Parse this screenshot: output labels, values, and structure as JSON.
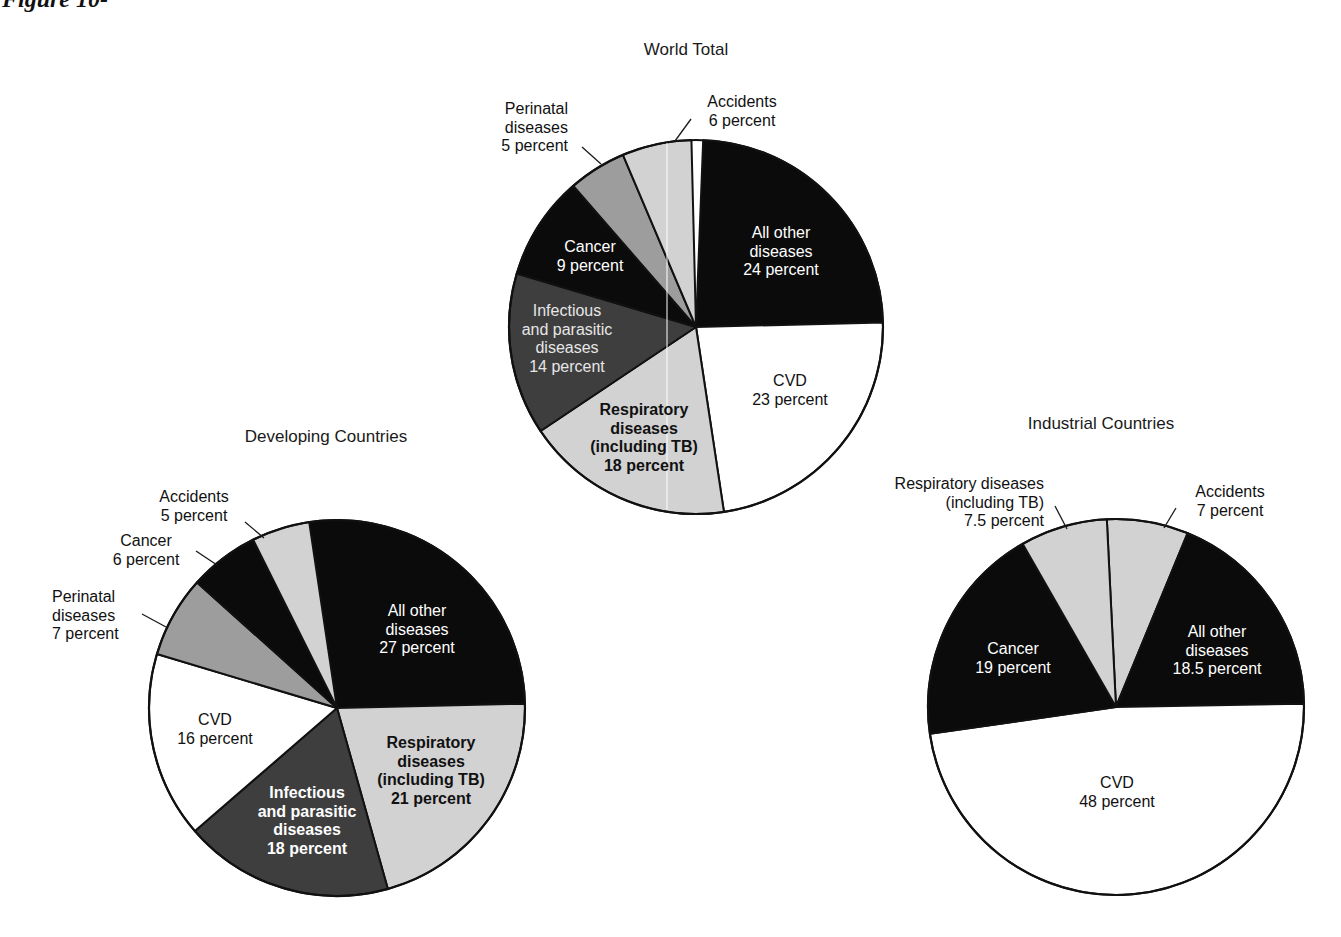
{
  "figure": {
    "heading": "Figure 10-"
  },
  "colors": {
    "black": "#0b0b0b",
    "dark_gray": "#3e3e3e",
    "medium_gray": "#9d9d9d",
    "light_gray": "#d2d2d2",
    "white": "#ffffff",
    "outline": "#111111"
  },
  "chart_data": [
    {
      "type": "pie",
      "title": "World Total",
      "unit": "percent",
      "start_angle_deg": 2.2,
      "center": [
        696,
        327
      ],
      "radius": 187,
      "slices": [
        {
          "label": "All other diseases",
          "value": 24,
          "fill": "black"
        },
        {
          "label": "CVD",
          "value": 23,
          "fill": "white"
        },
        {
          "label": "Respiratory diseases (including TB)",
          "value": 18,
          "fill": "light_gray"
        },
        {
          "label": "Infectious and parasitic diseases",
          "value": 14,
          "fill": "dark_gray"
        },
        {
          "label": "Cancer",
          "value": 9,
          "fill": "black"
        },
        {
          "label": "Perinatal diseases",
          "value": 5,
          "fill": "medium_gray"
        },
        {
          "label": "Accidents",
          "value": 6,
          "fill": "light_gray"
        }
      ]
    },
    {
      "type": "pie",
      "title": "Developing Countries",
      "unit": "percent",
      "start_angle_deg": -8.5,
      "center": [
        337,
        708
      ],
      "radius": 188,
      "slices": [
        {
          "label": "All other diseases",
          "value": 27,
          "fill": "black"
        },
        {
          "label": "Respiratory diseases (including TB)",
          "value": 21,
          "fill": "light_gray"
        },
        {
          "label": "Infectious and parasitic diseases",
          "value": 18,
          "fill": "dark_gray"
        },
        {
          "label": "CVD",
          "value": 16,
          "fill": "white"
        },
        {
          "label": "Perinatal diseases",
          "value": 7,
          "fill": "medium_gray"
        },
        {
          "label": "Cancer",
          "value": 6,
          "fill": "black"
        },
        {
          "label": "Accidents",
          "value": 5,
          "fill": "light_gray"
        }
      ]
    },
    {
      "type": "pie",
      "title": "Industrial Countries",
      "unit": "percent",
      "start_angle_deg": -2.8,
      "center": [
        1116,
        707
      ],
      "radius": 188,
      "slices": [
        {
          "label": "Accidents",
          "value": 7,
          "fill": "light_gray"
        },
        {
          "label": "All other diseases",
          "value": 18.5,
          "fill": "black"
        },
        {
          "label": "CVD",
          "value": 48,
          "fill": "white"
        },
        {
          "label": "Cancer",
          "value": 19,
          "fill": "black"
        },
        {
          "label": "Respiratory diseases (including TB)",
          "value": 7.5,
          "fill": "light_gray"
        }
      ]
    }
  ],
  "titles": {
    "world": {
      "text": "World Total",
      "x": 686,
      "y": 55
    },
    "developing": {
      "text": "Developing Countries",
      "x": 326,
      "y": 442
    },
    "industrial": {
      "text": "Industrial Countries",
      "x": 1101,
      "y": 429
    }
  },
  "labels": [
    {
      "id": "world-perinatal",
      "lines": [
        "Perinatal",
        "diseases",
        "5 percent"
      ],
      "x": 568,
      "y": 114,
      "anchor": "end",
      "color": "#111",
      "bold": false
    },
    {
      "id": "world-accidents",
      "lines": [
        "Accidents",
        "6 percent"
      ],
      "x": 742,
      "y": 107,
      "anchor": "middle",
      "color": "#111",
      "bold": false
    },
    {
      "id": "world-cancer",
      "lines": [
        "Cancer",
        "9 percent"
      ],
      "x": 590,
      "y": 252,
      "anchor": "middle",
      "color": "#fff",
      "bold": false
    },
    {
      "id": "world-all-other",
      "lines": [
        "All other",
        "diseases",
        "24 percent"
      ],
      "x": 781,
      "y": 238,
      "anchor": "middle",
      "color": "#fff",
      "bold": false
    },
    {
      "id": "world-infectious",
      "lines": [
        "Infectious",
        "and parasitic",
        "diseases",
        "14 percent"
      ],
      "x": 567,
      "y": 316,
      "anchor": "middle",
      "color": "#e6e6e6",
      "bold": false
    },
    {
      "id": "world-cvd",
      "lines": [
        "CVD",
        "23 percent"
      ],
      "x": 790,
      "y": 386,
      "anchor": "middle",
      "color": "#111",
      "bold": false
    },
    {
      "id": "world-respiratory",
      "lines": [
        "Respiratory",
        "diseases",
        "(including TB)",
        "18 percent"
      ],
      "x": 644,
      "y": 415,
      "anchor": "middle",
      "color": "#111",
      "bold": true
    },
    {
      "id": "dev-accidents",
      "lines": [
        "Accidents",
        "5 percent"
      ],
      "x": 194,
      "y": 502,
      "anchor": "middle",
      "color": "#111",
      "bold": false
    },
    {
      "id": "dev-cancer",
      "lines": [
        "Cancer",
        "6 percent"
      ],
      "x": 146,
      "y": 546,
      "anchor": "middle",
      "color": "#111",
      "bold": false
    },
    {
      "id": "dev-perinatal",
      "lines": [
        "Perinatal",
        "diseases",
        "7 percent"
      ],
      "x": 52,
      "y": 602,
      "anchor": "start",
      "color": "#111",
      "bold": false
    },
    {
      "id": "dev-all-other",
      "lines": [
        "All other",
        "diseases",
        "27 percent"
      ],
      "x": 417,
      "y": 616,
      "anchor": "middle",
      "color": "#fff",
      "bold": false
    },
    {
      "id": "dev-cvd",
      "lines": [
        "CVD",
        "16 percent"
      ],
      "x": 215,
      "y": 725,
      "anchor": "middle",
      "color": "#111",
      "bold": false
    },
    {
      "id": "dev-respiratory",
      "lines": [
        "Respiratory",
        "diseases",
        "(including TB)",
        "21 percent"
      ],
      "x": 431,
      "y": 748,
      "anchor": "middle",
      "color": "#111",
      "bold": true
    },
    {
      "id": "dev-infectious",
      "lines": [
        "Infectious",
        "and parasitic",
        "diseases",
        "18 percent"
      ],
      "x": 307,
      "y": 798,
      "anchor": "middle",
      "color": "#fff",
      "bold": true
    },
    {
      "id": "ind-respiratory",
      "lines": [
        "Respiratory diseases",
        "(including TB)",
        "7.5 percent"
      ],
      "x": 1044,
      "y": 489,
      "anchor": "end",
      "color": "#111",
      "bold": false
    },
    {
      "id": "ind-accidents",
      "lines": [
        "Accidents",
        "7 percent"
      ],
      "x": 1230,
      "y": 497,
      "anchor": "middle",
      "color": "#111",
      "bold": false
    },
    {
      "id": "ind-cancer",
      "lines": [
        "Cancer",
        "19 percent"
      ],
      "x": 1013,
      "y": 654,
      "anchor": "middle",
      "color": "#fff",
      "bold": false
    },
    {
      "id": "ind-all-other",
      "lines": [
        "All other",
        "diseases",
        "18.5 percent"
      ],
      "x": 1217,
      "y": 637,
      "anchor": "middle",
      "color": "#fff",
      "bold": false
    },
    {
      "id": "ind-cvd",
      "lines": [
        "CVD",
        "48 percent"
      ],
      "x": 1117,
      "y": 788,
      "anchor": "middle",
      "color": "#111",
      "bold": false
    }
  ],
  "leaders": [
    {
      "id": "world-perinatal-leader",
      "x1": 582,
      "y1": 147,
      "x2": 601,
      "y2": 164
    },
    {
      "id": "world-accidents-leader",
      "x1": 691,
      "y1": 119,
      "x2": 675,
      "y2": 141
    },
    {
      "id": "dev-accidents-leader",
      "x1": 245,
      "y1": 522,
      "x2": 264,
      "y2": 538
    },
    {
      "id": "dev-cancer-leader",
      "x1": 196,
      "y1": 551,
      "x2": 217,
      "y2": 565
    },
    {
      "id": "dev-perinatal-leader",
      "x1": 142,
      "y1": 614,
      "x2": 166,
      "y2": 627
    },
    {
      "id": "ind-respiratory-leader",
      "x1": 1055,
      "y1": 506,
      "x2": 1067,
      "y2": 529
    },
    {
      "id": "ind-accidents-leader",
      "x1": 1176,
      "y1": 508,
      "x2": 1164,
      "y2": 528
    }
  ]
}
